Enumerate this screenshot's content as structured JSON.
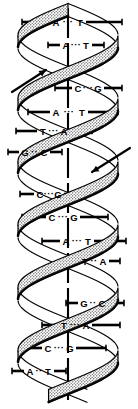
{
  "figure": {
    "axis_label": "central-axis",
    "colors": {
      "ink": "#000000",
      "background": "#ffffff",
      "ribbon_fill": "#cfcfcf",
      "ribbon_edge": "#000000"
    },
    "bond_symbol": "···"
  },
  "chart_data": {
    "type": "diagram",
    "base_pairs": [
      {
        "left": "A",
        "right": "T",
        "y": 22,
        "bond": "···",
        "x_left": 56,
        "x_right": 80,
        "tick_left_x1": 22,
        "tick_left_x2": 50,
        "tick_right_x1": 86,
        "tick_right_x2": 122
      },
      {
        "left": "A",
        "right": "T",
        "y": 45,
        "bond": "···",
        "x_left": 66,
        "x_right": 86,
        "tick_left_x1": 48,
        "tick_left_x2": 60,
        "tick_right_x1": 92,
        "tick_right_x2": 104
      },
      {
        "left": "C",
        "right": "G",
        "y": 88,
        "bond": "···",
        "x_left": 78,
        "x_right": 98,
        "tick_left_x1": 55,
        "tick_left_x2": 72,
        "tick_right_x1": 104,
        "tick_right_x2": 122
      },
      {
        "left": "A",
        "right": "T",
        "y": 112,
        "bond": "···",
        "x_left": 56,
        "x_right": 82,
        "tick_left_x1": 28,
        "tick_left_x2": 50,
        "tick_right_x1": 88,
        "tick_right_x2": 118
      },
      {
        "left": "T",
        "right": "A",
        "y": 131,
        "bond": "···",
        "x_left": 43,
        "x_right": 64,
        "tick_left_x1": 16,
        "tick_left_x2": 37,
        "tick_right_x1": 70,
        "tick_right_x2": 92
      },
      {
        "left": "G",
        "right": "C",
        "y": 152,
        "bond": "··",
        "x_left": 25,
        "x_right": 44,
        "tick_left_x1": 8,
        "tick_left_x2": 19,
        "tick_right_x1": 50,
        "tick_right_x2": 62
      },
      {
        "left": "C",
        "right": "G",
        "y": 194,
        "bond": "···",
        "x_left": 40,
        "x_right": 58,
        "tick_left_x1": 20,
        "tick_left_x2": 34,
        "tick_right_x1": 64,
        "tick_right_x2": 76
      },
      {
        "left": "C",
        "right": "G",
        "y": 217,
        "bond": "···",
        "x_left": 52,
        "x_right": 74,
        "tick_left_x1": 22,
        "tick_left_x2": 46,
        "tick_right_x1": 80,
        "tick_right_x2": 108
      },
      {
        "left": "A",
        "right": "T",
        "y": 241,
        "bond": "···",
        "x_left": 66,
        "x_right": 88,
        "tick_left_x1": 42,
        "tick_left_x2": 60,
        "tick_right_x1": 94,
        "tick_right_x2": 126
      },
      {
        "left": "T",
        "right": "A",
        "y": 261,
        "bond": "··",
        "x_left": 85,
        "x_right": 103,
        "tick_left_x1": 66,
        "tick_left_x2": 79,
        "tick_right_x1": 109,
        "tick_right_x2": 120
      },
      {
        "left": "G",
        "right": "C",
        "y": 303,
        "bond": "··",
        "x_left": 84,
        "x_right": 102,
        "tick_left_x1": 66,
        "tick_left_x2": 78,
        "tick_right_x1": 108,
        "tick_right_x2": 124
      },
      {
        "left": "T",
        "right": "A",
        "y": 325,
        "bond": "···",
        "x_left": 64,
        "x_right": 86,
        "tick_left_x1": 42,
        "tick_left_x2": 58,
        "tick_right_x1": 92,
        "tick_right_x2": 120
      },
      {
        "left": "C",
        "right": "G",
        "y": 348,
        "bond": "···",
        "x_left": 48,
        "x_right": 70,
        "tick_left_x1": 22,
        "tick_left_x2": 42,
        "tick_right_x1": 76,
        "tick_right_x2": 106
      },
      {
        "left": "A",
        "right": "T",
        "y": 371,
        "bond": "··",
        "x_left": 30,
        "x_right": 48,
        "tick_left_x1": 12,
        "tick_left_x2": 24,
        "tick_right_x1": 54,
        "tick_right_x2": 66
      }
    ],
    "annotations": [
      {
        "name": "strand-direction-arrow-up-left",
        "kind": "arrow",
        "x1": 12,
        "y1": 92,
        "x2": 46,
        "y2": 70
      },
      {
        "name": "strand-direction-arrow-down-right",
        "kind": "arrow",
        "x1": 130,
        "y1": 148,
        "x2": 92,
        "y2": 172
      }
    ],
    "axis": {
      "x": 68,
      "y_top": 8,
      "y_bottom": 400
    },
    "helix": {
      "turns": 3,
      "period": 126,
      "amplitude": 50,
      "ribbon_width": 13,
      "center_x": 68,
      "y_start": 10,
      "y_end": 396
    }
  }
}
